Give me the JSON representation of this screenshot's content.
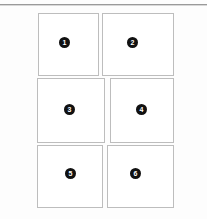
{
  "page": {
    "background_color": "#fdfdfd",
    "panel_background_color": "#ffffff",
    "panel_border_color": "#bdbdbd",
    "badge_color": "#111111",
    "badge_text_color": "#ffffff",
    "rule_color": "#9a9a9a"
  },
  "top_rule": {
    "name": "horizontal-rule"
  },
  "grid": {
    "rows": 3,
    "columns": 2,
    "panels": [
      {
        "id": "panel-1",
        "badge_label": "1",
        "x": 38,
        "y": 13,
        "width": 61,
        "height": 63,
        "badge_x": 59,
        "badge_y": 37
      },
      {
        "id": "panel-2",
        "badge_label": "2",
        "x": 102,
        "y": 13,
        "width": 72,
        "height": 63,
        "badge_x": 127,
        "badge_y": 37
      },
      {
        "id": "panel-3",
        "badge_label": "3",
        "x": 37,
        "y": 78,
        "width": 68,
        "height": 65,
        "badge_x": 64,
        "badge_y": 104
      },
      {
        "id": "panel-4",
        "badge_label": "4",
        "x": 110,
        "y": 78,
        "width": 64,
        "height": 65,
        "badge_x": 136,
        "badge_y": 104
      },
      {
        "id": "panel-5",
        "badge_label": "5",
        "x": 37,
        "y": 145,
        "width": 66,
        "height": 63,
        "badge_x": 65,
        "badge_y": 168
      },
      {
        "id": "panel-6",
        "badge_label": "6",
        "x": 107,
        "y": 145,
        "width": 67,
        "height": 63,
        "badge_x": 130,
        "badge_y": 168
      }
    ]
  }
}
